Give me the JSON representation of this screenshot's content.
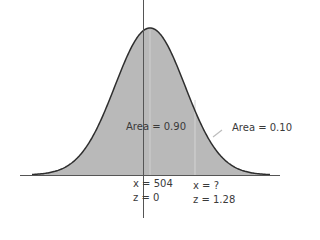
{
  "chart_data": {
    "type": "area",
    "title": "",
    "distribution": "normal",
    "mean_x": 504,
    "mean_z": 0,
    "cutoff_x": "?",
    "cutoff_z": 1.28,
    "areas": [
      {
        "label": "Area = 0.90",
        "value": 0.9,
        "region": "left of z = 1.28"
      },
      {
        "label": "Area = 0.10",
        "value": 0.1,
        "region": "right of z = 1.28"
      }
    ],
    "annotations": [
      "x = 504",
      "z = 0",
      "x = ?",
      "z = 1.28"
    ],
    "grid": false,
    "legend": null
  },
  "labels": {
    "area_left": "Area = 0.90",
    "area_right": "Area = 0.10",
    "mean_x": "x = 504",
    "mean_z": "z = 0",
    "cut_x": "x = ?",
    "cut_z": "z = 1.28"
  },
  "colors": {
    "fill": "#b9b9b9",
    "curve": "#2e2e2e",
    "axis": "#555555"
  }
}
